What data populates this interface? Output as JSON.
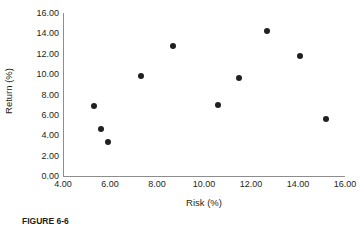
{
  "chart_data": {
    "type": "scatter",
    "title": "",
    "xlabel": "Risk (%)",
    "ylabel": "Return (%)",
    "xlim": [
      4.0,
      16.0
    ],
    "ylim": [
      0.0,
      16.0
    ],
    "grid": false,
    "legend": null,
    "xticks": [
      "4.00",
      "6.00",
      "8.00",
      "10.00",
      "12.00",
      "14.00",
      "16.00"
    ],
    "xtick_values": [
      4,
      6,
      8,
      10,
      12,
      14,
      16
    ],
    "yticks": [
      "0.00",
      "2.00",
      "4.00",
      "6.00",
      "8.00",
      "10.00",
      "12.00",
      "14.00",
      "16.00"
    ],
    "ytick_values": [
      0,
      2,
      4,
      6,
      8,
      10,
      12,
      14,
      16
    ],
    "marker": "circle",
    "marker_color": "#231f20",
    "points": [
      {
        "x": 5.3,
        "y": 6.9
      },
      {
        "x": 5.6,
        "y": 4.6
      },
      {
        "x": 5.9,
        "y": 3.3
      },
      {
        "x": 7.3,
        "y": 9.8
      },
      {
        "x": 8.7,
        "y": 12.8
      },
      {
        "x": 10.6,
        "y": 7.0
      },
      {
        "x": 11.5,
        "y": 9.6
      },
      {
        "x": 12.7,
        "y": 14.2
      },
      {
        "x": 14.1,
        "y": 11.8
      },
      {
        "x": 15.2,
        "y": 5.6
      }
    ]
  },
  "caption": {
    "label": "FIGURE 6-6"
  }
}
